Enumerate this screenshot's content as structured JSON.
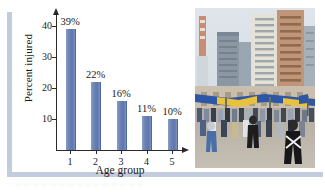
{
  "figure": {
    "name": "percent-injured-by-age-group-figure",
    "caption_blurred": "· · — — — — — — — — — — — — — — —"
  },
  "chart_data": {
    "type": "bar",
    "title": "",
    "xlabel": "Age group",
    "ylabel": "Percent injured",
    "categories": [
      "1",
      "2",
      "3",
      "4",
      "5"
    ],
    "values": [
      39,
      22,
      16,
      11,
      10
    ],
    "data_labels": [
      "39%",
      "22%",
      "16%",
      "11%",
      "10%"
    ],
    "yticks": [
      10,
      20,
      30,
      40
    ],
    "ytick_labels": [
      "10",
      "20",
      "30",
      "40"
    ],
    "ylim": [
      0,
      44
    ],
    "grid": false,
    "legend": null,
    "bar_color": "#6d84b6",
    "axis_color": "#2a2a2a"
  },
  "photo": {
    "alt_name": "city-street-crowd-photo",
    "description": "City street scene with tall buildings, a blue and yellow banner over the road, and a crowd of people",
    "colors": {
      "sky": "#d7dde4",
      "building_light": "#e2e0d8",
      "building_tan": "#c09578",
      "banner_blue": "#2e56a6",
      "banner_yellow": "#e8c23a",
      "street": "#b9b2a6"
    }
  },
  "frame": {
    "rule_color": "#c3ccdd"
  }
}
